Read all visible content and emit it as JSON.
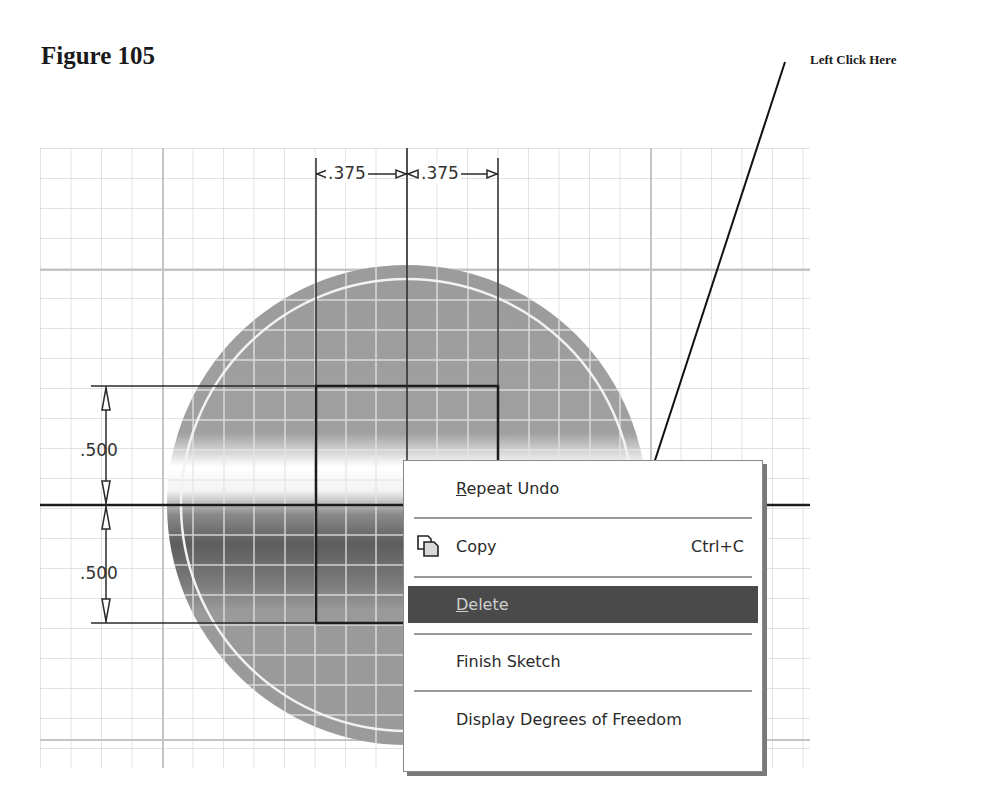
{
  "figure": {
    "title": "Figure 105"
  },
  "callout": {
    "text": "Left Click Here",
    "target": "Delete"
  },
  "sketch": {
    "horizontal_dimensions": [
      ".375",
      ".375"
    ],
    "vertical_dimensions": [
      ".500",
      ".500"
    ],
    "colors": {
      "grid": "#d4d4d4",
      "grid_major": "#bdbdbd",
      "circle_fill": "#9a9a9a",
      "sketch_line": "#1c1c1c"
    }
  },
  "context_menu": {
    "items": [
      {
        "label": "Repeat Undo",
        "mnemonic": "R",
        "rest": "epeat Undo",
        "shortcut": "",
        "icon": "",
        "selected": false
      },
      {
        "label": "Copy",
        "mnemonic": "",
        "rest": "Copy",
        "shortcut": "Ctrl+C",
        "icon": "copy-icon",
        "selected": false
      },
      {
        "label": "Delete",
        "mnemonic": "D",
        "rest": "elete",
        "shortcut": "",
        "icon": "",
        "selected": true
      },
      {
        "label": "Finish Sketch",
        "mnemonic": "",
        "rest": "Finish Sketch",
        "shortcut": "",
        "icon": "",
        "selected": false
      },
      {
        "label": "Display Degrees of Freedom",
        "mnemonic": "",
        "rest": "Display Degrees of Freedom",
        "shortcut": "",
        "icon": "",
        "selected": false
      }
    ],
    "colors": {
      "selected_bg": "#4a4a4a",
      "selected_text": "#cfcfcf"
    }
  }
}
